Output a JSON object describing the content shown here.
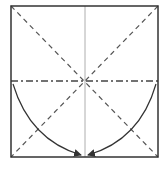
{
  "diagram": {
    "type": "origami-fold-step",
    "colors": {
      "background": "#ffffff",
      "outline": "#333333",
      "crease": "#555555",
      "center_line": "#999999",
      "arrow": "#333333"
    },
    "elements": [
      {
        "name": "paper-square",
        "kind": "outline"
      },
      {
        "name": "diagonal-tl-br",
        "kind": "valley-fold-dashed"
      },
      {
        "name": "diagonal-tr-bl",
        "kind": "valley-fold-dashed"
      },
      {
        "name": "vertical-center",
        "kind": "crease-solid-thin"
      },
      {
        "name": "horizontal-center",
        "kind": "mountain-fold-dash-dot"
      },
      {
        "name": "left-arrow",
        "kind": "curved-arrow"
      },
      {
        "name": "right-arrow",
        "kind": "curved-arrow"
      }
    ]
  }
}
